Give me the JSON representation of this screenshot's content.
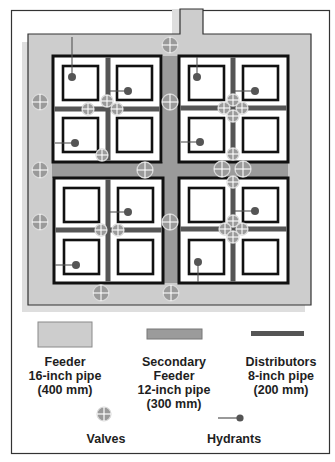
{
  "colors": {
    "feeder": "#cdcdcd",
    "feeder_shadow": "#dedede",
    "secondary_feeder": "#9b9b9b",
    "distributor": "#555555",
    "block_border": "#111111",
    "valve_fill": "#9a9a9a",
    "valve_ring": "#dadada",
    "hydrant": "#555555",
    "frame": "#333333"
  },
  "legend": {
    "feeder": {
      "lines": [
        "Feeder",
        "16-inch pipe",
        "(400 mm)"
      ]
    },
    "secondary_feeder": {
      "lines": [
        "Secondary",
        "Feeder",
        "12-inch pipe",
        "(300 mm)"
      ]
    },
    "distributors": {
      "lines": [
        "Distributors",
        "8-inch pipe",
        "(200 mm)"
      ]
    },
    "valves": {
      "label": "Valves"
    },
    "hydrants": {
      "label": "Hydrants"
    }
  },
  "diagram": {
    "quadrants": [
      {
        "name": "block-top-left",
        "x": 53,
        "y": 56,
        "w": 108,
        "h": 106,
        "vx": 108,
        "hy": 109
      },
      {
        "name": "block-top-right",
        "x": 179,
        "y": 56,
        "w": 109,
        "h": 106,
        "vx": 233,
        "hy": 108
      },
      {
        "name": "block-bottom-left",
        "x": 54,
        "y": 178,
        "w": 109,
        "h": 105,
        "vx": 108,
        "hy": 230
      },
      {
        "name": "block-bottom-right",
        "x": 179,
        "y": 178,
        "w": 109,
        "h": 105,
        "vx": 233,
        "hy": 229
      }
    ],
    "secondary_feeder": [
      {
        "x": 163,
        "y": 56,
        "w": 15,
        "h": 227
      },
      {
        "x": 52,
        "y": 162,
        "w": 236,
        "h": 16
      }
    ],
    "valves": [
      {
        "x": 170,
        "y": 45,
        "r": 8
      },
      {
        "x": 40,
        "y": 102,
        "r": 8
      },
      {
        "x": 40,
        "y": 170,
        "r": 8
      },
      {
        "x": 40,
        "y": 222,
        "r": 8
      },
      {
        "x": 101,
        "y": 293,
        "r": 8
      },
      {
        "x": 171,
        "y": 293,
        "r": 8
      },
      {
        "x": 170,
        "y": 102,
        "r": 8
      },
      {
        "x": 145,
        "y": 170,
        "r": 8
      },
      {
        "x": 222,
        "y": 169,
        "r": 8
      },
      {
        "x": 243,
        "y": 169,
        "r": 8
      },
      {
        "x": 170,
        "y": 222,
        "r": 8
      },
      {
        "x": 107,
        "y": 101,
        "r": 6
      },
      {
        "x": 88,
        "y": 109,
        "r": 6
      },
      {
        "x": 117,
        "y": 109,
        "r": 6
      },
      {
        "x": 102,
        "y": 155,
        "r": 6
      },
      {
        "x": 233,
        "y": 100,
        "r": 6
      },
      {
        "x": 224,
        "y": 108,
        "r": 6
      },
      {
        "x": 242,
        "y": 108,
        "r": 6
      },
      {
        "x": 233,
        "y": 116,
        "r": 6
      },
      {
        "x": 233,
        "y": 154,
        "r": 6
      },
      {
        "x": 233,
        "y": 182,
        "r": 6
      },
      {
        "x": 101,
        "y": 230,
        "r": 6
      },
      {
        "x": 118,
        "y": 230,
        "r": 6
      },
      {
        "x": 233,
        "y": 221,
        "r": 6
      },
      {
        "x": 225,
        "y": 229,
        "r": 6
      },
      {
        "x": 242,
        "y": 229,
        "r": 6
      },
      {
        "x": 233,
        "y": 237,
        "r": 6
      }
    ],
    "hydrants": [
      {
        "x": 72,
        "y": 77,
        "x1": 72,
        "y1": 37
      },
      {
        "x": 128,
        "y": 91,
        "x1": 108,
        "y1": 91
      },
      {
        "x": 75,
        "y": 143,
        "x1": 55,
        "y1": 143
      },
      {
        "x": 197,
        "y": 77,
        "x1": 197,
        "y1": 57
      },
      {
        "x": 255,
        "y": 91,
        "x1": 233,
        "y1": 91
      },
      {
        "x": 200,
        "y": 142,
        "x1": 181,
        "y1": 142
      },
      {
        "x": 128,
        "y": 212,
        "x1": 108,
        "y1": 212
      },
      {
        "x": 76,
        "y": 265,
        "x1": 55,
        "y1": 265
      },
      {
        "x": 255,
        "y": 211,
        "x1": 233,
        "y1": 211
      },
      {
        "x": 198,
        "y": 262,
        "x1": 198,
        "y1": 282
      }
    ]
  }
}
